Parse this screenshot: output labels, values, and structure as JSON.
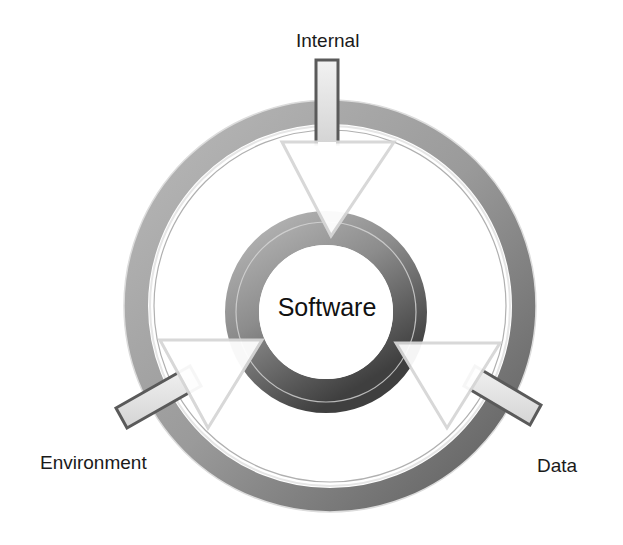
{
  "diagram": {
    "type": "cycle-inputs",
    "center": {
      "label": "Software"
    },
    "inputs": [
      {
        "label": "Internal",
        "direction": "top"
      },
      {
        "label": "Environment",
        "direction": "bottom-left"
      },
      {
        "label": "Data",
        "direction": "bottom-right"
      }
    ]
  },
  "colors": {
    "outer_ring": "#9a9a9a",
    "outer_ring_dark": "#5e5e5e",
    "inner_ring": "#8a8a8a",
    "inner_ring_dark": "#4a4a4a",
    "arrow_fill": "#ffffff",
    "arrow_edge": "#d9d9d9",
    "shaft_edge": "#555555",
    "text": "#1a1a1a"
  }
}
